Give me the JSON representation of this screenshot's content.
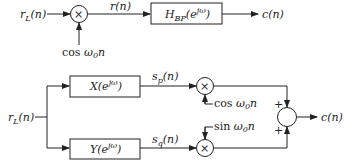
{
  "top_system": {
    "input": "r_L(n)",
    "multiplier": "×",
    "carrier": "cos ω0n",
    "mid_signal": "r(n)",
    "filter": "H_BP(e^jω)",
    "output": "c(n)"
  },
  "bottom_system": {
    "input": "r_L(n)",
    "filter_upper": "X(e^jω)",
    "filter_lower": "Y(e^jω)",
    "signal_upper": "s_p(n)",
    "signal_lower": "s_q(n)",
    "carrier_upper": "cos ω0n",
    "carrier_lower": "sin ω0n",
    "sum_signs": [
      "+",
      "+"
    ],
    "output": "c(n)"
  },
  "colors": {
    "line": "#222222",
    "background": "#ffffff"
  }
}
